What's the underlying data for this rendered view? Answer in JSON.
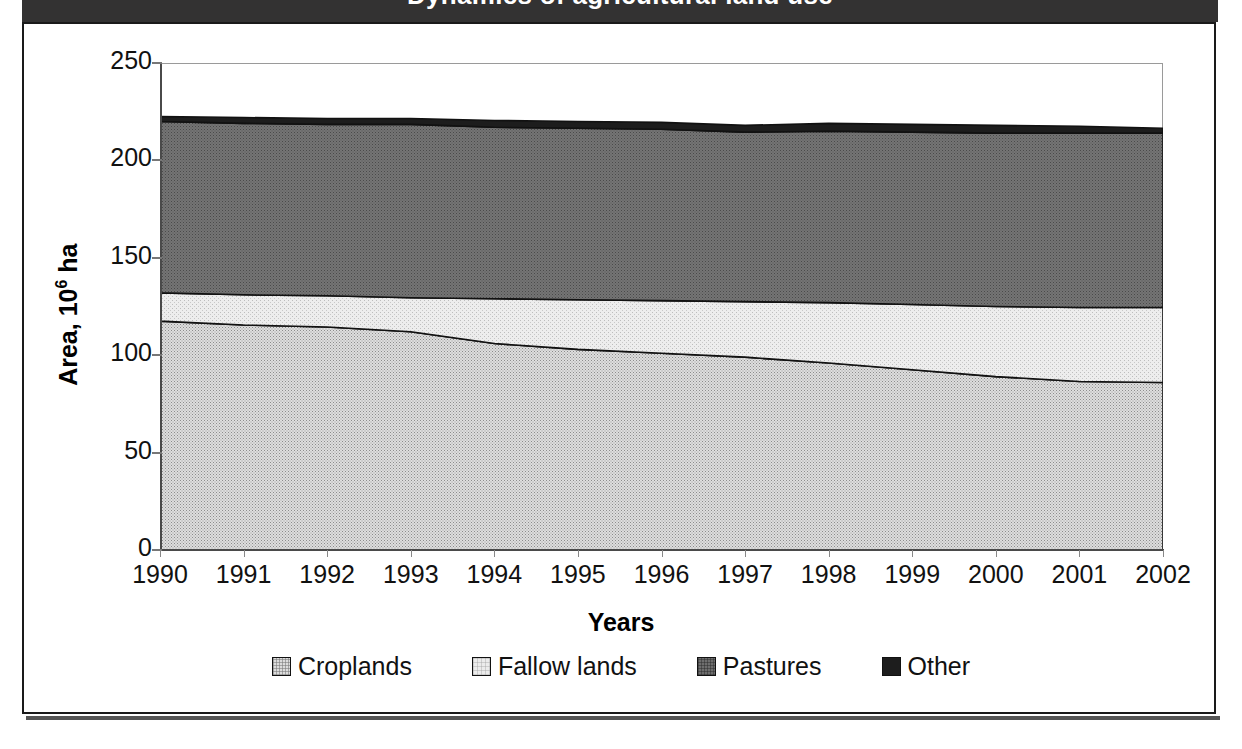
{
  "window": {
    "title_bar_color": "#333232",
    "title": "Dynamics of agricultural land use",
    "frame_color": "#1a1a1a"
  },
  "chart_data": {
    "type": "area",
    "stacked": true,
    "title": "Dynamics of agricultural land use",
    "xlabel": "Years",
    "ylabel": "Area, 10⁶ ha",
    "ylabel_prefix": "Area, 10",
    "ylabel_exponent": "6",
    "ylabel_suffix": " ha",
    "grid": false,
    "legend_position": "bottom",
    "xlim": [
      1990,
      2002
    ],
    "ylim": [
      0,
      250
    ],
    "yticks": [
      0,
      50,
      100,
      150,
      200,
      250
    ],
    "categories": [
      "1990",
      "1991",
      "1992",
      "1993",
      "1994",
      "1995",
      "1996",
      "1997",
      "1998",
      "1999",
      "2000",
      "2001",
      "2002"
    ],
    "x": [
      1990,
      1991,
      1992,
      1993,
      1994,
      1995,
      1996,
      1997,
      1998,
      1999,
      2000,
      2001,
      2002
    ],
    "series": [
      {
        "name": "Croplands",
        "id": "croplands",
        "color": "#dcdcdc",
        "pattern": "fine-dotted-light",
        "values": [
          117.5,
          115.5,
          114.5,
          112.0,
          106.0,
          103.0,
          101.0,
          99.0,
          96.0,
          92.5,
          89.0,
          86.5,
          86.0
        ]
      },
      {
        "name": "Fallow lands",
        "id": "fallow",
        "color": "#ececec",
        "pattern": "very-light-dotted",
        "values": [
          14.5,
          15.5,
          16.0,
          17.5,
          23.0,
          25.5,
          27.0,
          28.5,
          31.0,
          33.5,
          36.0,
          38.0,
          38.5
        ]
      },
      {
        "name": "Pastures",
        "id": "pastures",
        "color": "#6e6e6e",
        "pattern": "medium-dark-dotted",
        "values": [
          88.0,
          88.0,
          88.0,
          89.0,
          88.0,
          88.0,
          88.0,
          87.0,
          88.0,
          88.5,
          89.0,
          89.5,
          89.5
        ]
      },
      {
        "name": "Other",
        "id": "other",
        "color": "#1d1d1d",
        "pattern": "solid-black",
        "values": [
          3.0,
          3.0,
          3.0,
          3.0,
          3.0,
          3.0,
          3.0,
          3.0,
          3.0,
          3.0,
          3.0,
          3.0,
          3.0
        ]
      }
    ],
    "cumulative_top": {
      "croplands": [
        117.5,
        115.5,
        114.5,
        112.0,
        106.0,
        103.0,
        101.0,
        99.0,
        96.0,
        92.5,
        89.0,
        86.5,
        86.0
      ],
      "fallow": [
        132.0,
        131.0,
        130.5,
        129.5,
        129.0,
        128.5,
        128.0,
        127.5,
        127.0,
        126.0,
        125.0,
        124.5,
        124.5
      ],
      "pastures": [
        220.0,
        219.0,
        218.5,
        218.5,
        217.0,
        216.5,
        216.0,
        214.5,
        215.0,
        214.5,
        214.0,
        214.0,
        214.0
      ],
      "other": [
        222.5,
        222.0,
        221.5,
        221.5,
        220.5,
        220.0,
        219.5,
        218.0,
        219.0,
        218.5,
        218.0,
        217.5,
        216.5
      ]
    }
  },
  "legend": {
    "items": [
      {
        "label": "Croplands",
        "swatch_class": "fill-croplands"
      },
      {
        "label": "Fallow lands",
        "swatch_class": "fill-fallow"
      },
      {
        "label": "Pastures",
        "swatch_class": "fill-pastures"
      },
      {
        "label": "Other",
        "swatch_class": "fill-other"
      }
    ]
  }
}
